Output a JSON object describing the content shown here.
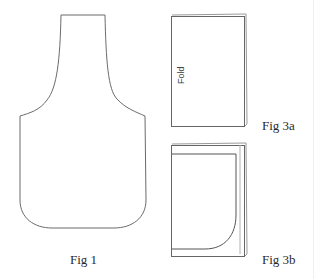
{
  "figures": {
    "fig1": {
      "label": "Fig 1",
      "shape": "apron-pattern-outline"
    },
    "fig3a": {
      "label": "Fig 3a",
      "fold_label": "Fold",
      "shape": "folded-fabric-rectangle"
    },
    "fig3b": {
      "label": "Fig 3b",
      "shape": "folded-fabric-with-cut-curve"
    }
  },
  "colors": {
    "stroke": "#555555",
    "stroke_light": "#9a9a9a",
    "text": "#2a2a2a",
    "background": "#ffffff"
  }
}
